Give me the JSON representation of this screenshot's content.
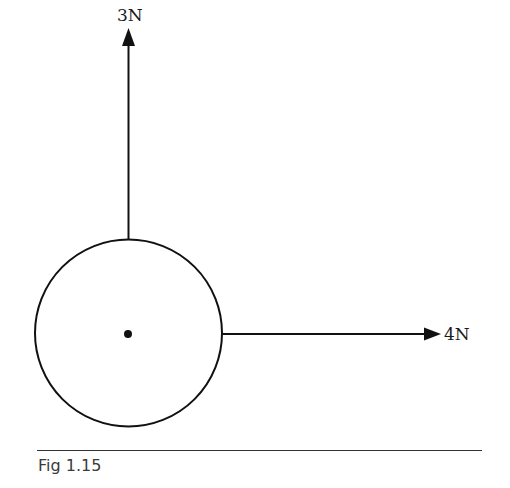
{
  "figure": {
    "caption": "Fig 1.15",
    "forces": [
      {
        "label": "3N",
        "direction": "up",
        "magnitude": 3,
        "unit": "N"
      },
      {
        "label": "4N",
        "direction": "right",
        "magnitude": 4,
        "unit": "N"
      }
    ],
    "body": {
      "shape": "circle",
      "center_marker": "dot"
    },
    "colors": {
      "stroke": "#111111",
      "background": "#ffffff"
    }
  }
}
